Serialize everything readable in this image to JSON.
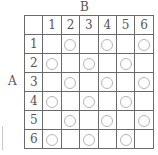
{
  "axis_labels": {
    "columns": "B",
    "rows": "A"
  },
  "column_headers": [
    "1",
    "2",
    "3",
    "4",
    "5",
    "6"
  ],
  "row_headers": [
    "1",
    "2",
    "3",
    "4",
    "5",
    "6"
  ],
  "marker": "circle",
  "grid": [
    [
      0,
      1,
      0,
      1,
      0,
      1
    ],
    [
      1,
      0,
      1,
      0,
      1,
      0
    ],
    [
      0,
      1,
      0,
      1,
      0,
      1
    ],
    [
      1,
      0,
      1,
      0,
      1,
      0
    ],
    [
      0,
      1,
      0,
      1,
      0,
      1
    ],
    [
      1,
      0,
      1,
      0,
      1,
      0
    ]
  ],
  "colors": {
    "grid_line": "#6a6a6a",
    "circle": "#b5b5b5",
    "text": "#555555"
  }
}
